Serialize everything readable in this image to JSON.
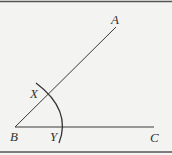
{
  "diagram": {
    "type": "geometric-construction",
    "points": {
      "A": {
        "label": "A",
        "x": 116,
        "y": 27
      },
      "B": {
        "label": "B",
        "x": 15,
        "y": 127
      },
      "C": {
        "label": "C",
        "x": 154,
        "y": 127
      },
      "X": {
        "label": "X",
        "x": 48,
        "y": 93
      },
      "Y": {
        "label": "Y",
        "x": 62,
        "y": 127
      }
    },
    "segments": [
      {
        "from": "B",
        "to": "A"
      },
      {
        "from": "B",
        "to": "C"
      }
    ],
    "arc": {
      "center": "B",
      "radius": 47
    },
    "colors": {
      "line": "#3a3a3a",
      "background": "#f3f3f1",
      "border": "#555555"
    }
  }
}
